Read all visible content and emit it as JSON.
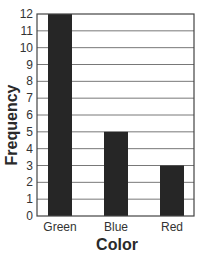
{
  "chart_data": {
    "type": "bar",
    "title": "",
    "categories": [
      "Green",
      "Blue",
      "Red"
    ],
    "values": [
      12,
      5,
      3
    ],
    "xlabel": "Color",
    "ylabel": "Frequency",
    "ylim": [
      0,
      12
    ],
    "yticks": [
      0,
      1,
      2,
      3,
      4,
      5,
      6,
      7,
      8,
      9,
      10,
      11,
      12
    ],
    "grid": true,
    "legend": null,
    "bar_color": "#262626",
    "grid_color": "#555555"
  }
}
